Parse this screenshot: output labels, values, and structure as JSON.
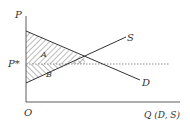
{
  "diagram": {
    "title": "",
    "y_axis_label": "P",
    "x_axis_label": "Q (D, S)",
    "origin_label": "O",
    "equilibrium_price_label": "P*",
    "curves": [
      {
        "name": "S",
        "label": "S",
        "type": "supply",
        "from": [
          26,
          83
        ],
        "to": [
          126,
          37
        ]
      },
      {
        "name": "D",
        "label": "D",
        "type": "demand",
        "from": [
          26,
          31
        ],
        "to": [
          140,
          80
        ]
      }
    ],
    "regions": [
      {
        "label": "A",
        "description": "consumer surplus (hatched, above P*, below D)"
      },
      {
        "label": "B",
        "description": "producer surplus (hatched, below P*, above S)"
      }
    ],
    "colors": {
      "line": "#333333",
      "hatch": "#555555",
      "dashed": "#777777"
    }
  }
}
